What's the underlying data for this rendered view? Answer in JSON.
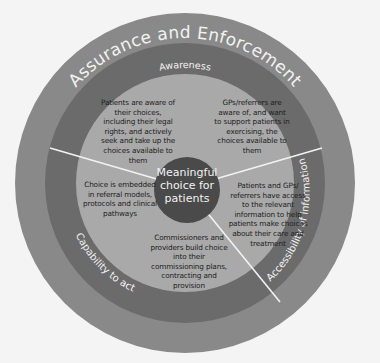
{
  "colors": {
    "background": "#f4f4f4",
    "outer_ring": "#898989",
    "middle_ring": "#6b6b6b",
    "inner_area": "#a9a9a9",
    "center_circle": "#4a4a4a",
    "divider": "#f2f2f2",
    "ring_text": "#f2f2f2",
    "body_text": "#1e1e1e"
  },
  "outer_ring": {
    "label": "Assurance and Enforcement"
  },
  "middle_ring": {
    "top_label": "Awareness",
    "left_label": "Capability to act",
    "right_label": "Accessibility of information"
  },
  "center": {
    "label": "Meaningful choice for patients"
  },
  "segments": [
    {
      "id": "top-left",
      "text": "Patients are aware of their choices, including their legal rights, and actively seek and take up the choices available to them"
    },
    {
      "id": "top-right",
      "text": "GPs/referrers are aware of, and want to support patients in exercising, the choices available to them"
    },
    {
      "id": "left",
      "text": "Choice is embedded in referral models, protocols and clinical pathways"
    },
    {
      "id": "right",
      "text": "Patients and GPs/ referrers have access to the relevant information to help patients make choices about their care and treatment"
    },
    {
      "id": "bottom",
      "text": "Commissioners and providers build choice into their commissioning plans, contracting and provision"
    }
  ]
}
